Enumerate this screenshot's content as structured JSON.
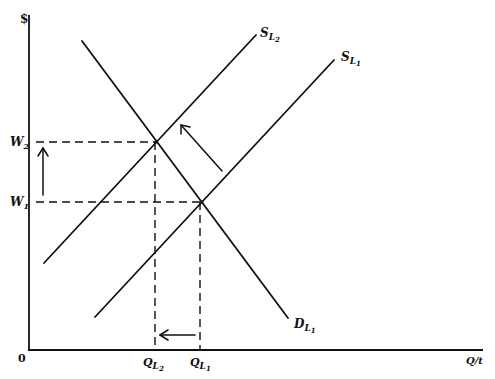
{
  "diagram": {
    "axes": {
      "y_label": "$",
      "x_label": "Q/t",
      "origin_label": "0"
    },
    "curves": [
      {
        "id": "D_L1",
        "label_main": "D",
        "label_sub": "L",
        "label_subsub": "1",
        "type": "demand"
      },
      {
        "id": "S_L1",
        "label_main": "S",
        "label_sub": "L",
        "label_subsub": "1",
        "type": "supply"
      },
      {
        "id": "S_L2",
        "label_main": "S",
        "label_sub": "L",
        "label_subsub": "2",
        "type": "supply"
      }
    ],
    "y_ticks": [
      {
        "label_main": "W",
        "label_sub": "2"
      },
      {
        "label_main": "W",
        "label_sub": "1"
      }
    ],
    "x_ticks": [
      {
        "label_main": "Q",
        "label_sub": "L",
        "label_subsub": "2"
      },
      {
        "label_main": "Q",
        "label_sub": "L",
        "label_subsub": "1"
      }
    ],
    "arrows": [
      {
        "name": "wage-increase-arrow",
        "direction": "up",
        "meaning": "W1 to W2"
      },
      {
        "name": "supply-shift-arrow",
        "direction": "up-left",
        "meaning": "S_L1 to S_L2"
      },
      {
        "name": "quantity-decrease-arrow",
        "direction": "left",
        "meaning": "Q_L1 to Q_L2"
      }
    ],
    "colors": {
      "line": "#111111",
      "background": "#ffffff"
    }
  }
}
